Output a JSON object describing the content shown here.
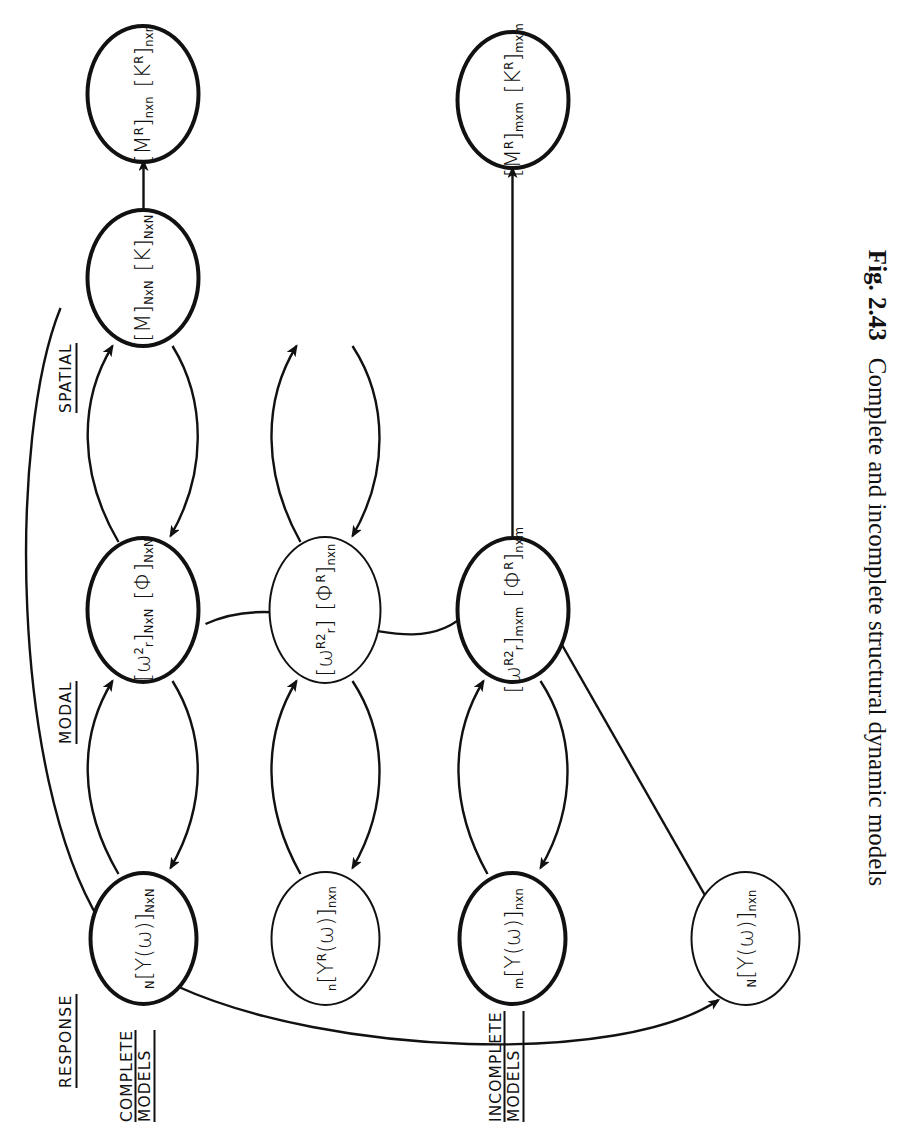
{
  "figure": {
    "caption_label": "Fig. 2.43",
    "caption_text": "Complete and incomplete structural dynamic models"
  },
  "column_headers": [
    {
      "id": "response",
      "label": "RESPONSE"
    },
    {
      "id": "modal",
      "label": "MODAL"
    },
    {
      "id": "spatial",
      "label": "SPATIAL"
    }
  ],
  "row_headers": [
    {
      "id": "complete-models",
      "line1": "COMPLETE",
      "line2": "MODELS"
    },
    {
      "id": "incomplete-models",
      "line1": "INCOMPLETE",
      "line2": "MODELS"
    }
  ],
  "nodes": {
    "response_1": {
      "presub": "N",
      "body": "[Y(ω)]",
      "sub": "NxN"
    },
    "response_2": {
      "presub": "n",
      "body": "[Y",
      "sup": "R",
      "body2": "(ω)]",
      "sub": "nxn"
    },
    "response_3": {
      "presub": "m",
      "body": "[Y(ω)]",
      "sub": "nxn"
    },
    "response_4": {
      "presub": "N",
      "body": "[Y(ω)]",
      "sub": "nxn"
    },
    "modal_1": {
      "t1": "[ω",
      "t1sup": "2",
      "t1sub": "r",
      "t1close": "]",
      "t1dim": "NxN",
      "t2": "[Φ]",
      "t2dim": "NxN"
    },
    "modal_2": {
      "t1": "[ω",
      "t1sup": "R2",
      "t1sub": "r",
      "t1close": "]",
      "t1dim": "",
      "t2": "[Φ",
      "t2sup": "R",
      "t2close": "]",
      "t2dim": "nxn"
    },
    "modal_3": {
      "t1": "[ω",
      "t1sup": "R2",
      "t1sub": "r",
      "t1close": "]",
      "t1dim": "mxm",
      "t2": "[Φ",
      "t2sup": "R",
      "t2close": "]",
      "t2dim": "nxm"
    },
    "spatial_1": {
      "a": "[M]",
      "adim": "NxN",
      "b": "[K]",
      "bdim": "NxN"
    },
    "spatial_2": {
      "a": "[M",
      "asup": "R",
      "aclose": "]",
      "adim": "nxn",
      "b": "[K",
      "bsup": "R",
      "bclose": "]",
      "bdim": "nxn"
    },
    "spatial_3": {
      "a": "[M",
      "asup": "R",
      "aclose": "]",
      "adim": "mxm",
      "b": "[K",
      "bsup": "R",
      "bclose": "]",
      "bdim": "mxm"
    }
  },
  "edges": [
    {
      "id": "r1-m1-up",
      "from": "response_1",
      "to": "modal_1",
      "kind": "curved-arrow"
    },
    {
      "id": "m1-r1-down",
      "from": "modal_1",
      "to": "response_1",
      "kind": "curved-arrow"
    },
    {
      "id": "m1-s1-up",
      "from": "modal_1",
      "to": "spatial_1",
      "kind": "curved-arrow"
    },
    {
      "id": "s1-m1-down",
      "from": "spatial_1",
      "to": "modal_1",
      "kind": "curved-arrow"
    },
    {
      "id": "s1-r1-long",
      "from": "spatial_1",
      "to": "response_1",
      "kind": "long-curve"
    },
    {
      "id": "r2-m2-up",
      "from": "response_2",
      "to": "modal_2",
      "kind": "curved-arrow"
    },
    {
      "id": "m2-r2-down",
      "from": "modal_2",
      "to": "response_2",
      "kind": "curved-arrow"
    },
    {
      "id": "m2-s2-up",
      "from": "modal_2",
      "to": "spatial_2",
      "kind": "curved-arrow"
    },
    {
      "id": "s2-m2-down",
      "from": "spatial_2",
      "to": "modal_2",
      "kind": "curved-arrow"
    },
    {
      "id": "s1-s2",
      "from": "spatial_1",
      "to": "spatial_2",
      "kind": "straight-arrow"
    },
    {
      "id": "r3-m3-up",
      "from": "response_3",
      "to": "modal_3",
      "kind": "curved-arrow"
    },
    {
      "id": "m3-r3-down",
      "from": "modal_3",
      "to": "response_3",
      "kind": "curved-arrow"
    },
    {
      "id": "m3-s3-up",
      "from": "modal_3",
      "to": "spatial_3",
      "kind": "straight-arrow"
    },
    {
      "id": "m1-m3",
      "from": "modal_1",
      "to": "modal_3",
      "kind": "long-curve"
    },
    {
      "id": "r4-m3",
      "from": "response_4",
      "to": "modal_3",
      "kind": "straight-arrow"
    },
    {
      "id": "r1-r4",
      "from": "response_1",
      "to": "response_4",
      "kind": "long-curve"
    }
  ],
  "style": {
    "ink": "#111111",
    "paper": "#ffffff"
  }
}
